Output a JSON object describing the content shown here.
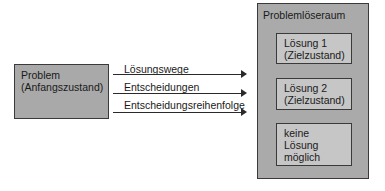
{
  "problem": {
    "line1": "Problem",
    "line2": "(Anfangszustand)"
  },
  "arrows": [
    {
      "label": "Lösungswege"
    },
    {
      "label": "Entscheidungen"
    },
    {
      "label": "Entscheidungsreihenfolge"
    }
  ],
  "problem_space": {
    "title": "Problemlöseraum",
    "outcomes": [
      {
        "line1": "Lösung 1",
        "line2": "(Zielzustand)"
      },
      {
        "line1": "Lösung 2",
        "line2": "(Zielzustand)"
      },
      {
        "line1": "keine",
        "line2": "Lösung",
        "line3": "möglich"
      }
    ]
  },
  "colors": {
    "outer_box": "#aaaaaa",
    "inner_box": "#c6c6c6",
    "problem_box": "#a9a9a9",
    "stroke": "#2a2a2a"
  }
}
